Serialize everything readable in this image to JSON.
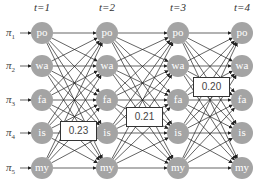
{
  "time_steps": [
    "t=1",
    "t=2",
    "t=3",
    "t=4"
  ],
  "priors": [
    {
      "symbol": "π",
      "sub": "1"
    },
    {
      "symbol": "π",
      "sub": "2"
    },
    {
      "symbol": "π",
      "sub": "3"
    },
    {
      "symbol": "π",
      "sub": "4"
    },
    {
      "symbol": "π",
      "sub": "5"
    }
  ],
  "states": [
    "po",
    "wa",
    "fa",
    "is",
    "my"
  ],
  "probability_labels": [
    {
      "value": "0.23",
      "between": "t=1 → t=2",
      "near_state": "is"
    },
    {
      "value": "0.21",
      "between": "t=2 → t=3",
      "near_state": "fa/is"
    },
    {
      "value": "0.20",
      "between": "t=3 → t=4",
      "near_state": "wa/fa"
    }
  ],
  "colors": {
    "node": "#a4a4a4",
    "edge": "#222222"
  }
}
